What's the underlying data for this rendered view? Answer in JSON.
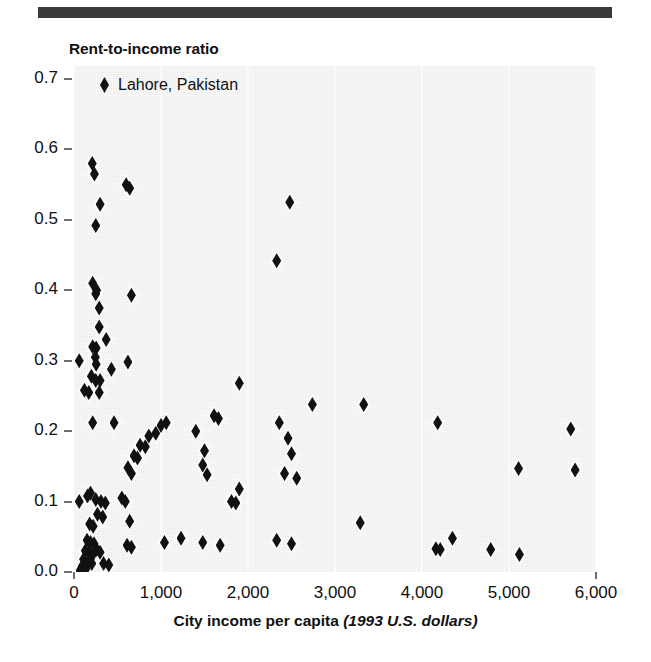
{
  "figure": {
    "y_axis_title": "Rent-to-income ratio",
    "x_axis_title_main": "City income per capita",
    "x_axis_title_units": "(1993 U.S. dollars)",
    "legend_label": "Lahore, Pakistan",
    "marker_color": "#111111",
    "plot_background": "#ebebeb",
    "rule_color": "#3a3a3a"
  },
  "chart_data": {
    "type": "scatter",
    "title": "",
    "xlabel": "City income per capita (1993 U.S. dollars)",
    "ylabel": "Rent-to-income ratio",
    "xlim": [
      0,
      6000
    ],
    "ylim": [
      0.0,
      0.7
    ],
    "xticks": [
      0,
      1000,
      2000,
      3000,
      4000,
      5000,
      6000
    ],
    "xtick_labels": [
      "0",
      "1,000",
      "2,000",
      "3,000",
      "4,000",
      "5,000",
      "6,000"
    ],
    "yticks": [
      0.0,
      0.1,
      0.2,
      0.3,
      0.4,
      0.5,
      0.6,
      0.7
    ],
    "ytick_labels": [
      "0.0",
      "0.1",
      "0.2",
      "0.3",
      "0.4",
      "0.5",
      "0.6",
      "0.7"
    ],
    "grid": "vertical",
    "legend_position": "top-left",
    "series": [
      {
        "name": "Lahore, Pakistan",
        "marker": "diamond",
        "color": "#111111",
        "points": [
          [
            210,
            0.58
          ],
          [
            235,
            0.565
          ],
          [
            300,
            0.522
          ],
          [
            600,
            0.55
          ],
          [
            640,
            0.545
          ],
          [
            2480,
            0.525
          ],
          [
            250,
            0.492
          ],
          [
            2330,
            0.442
          ],
          [
            215,
            0.41
          ],
          [
            260,
            0.4
          ],
          [
            250,
            0.395
          ],
          [
            290,
            0.375
          ],
          [
            660,
            0.393
          ],
          [
            290,
            0.348
          ],
          [
            215,
            0.32
          ],
          [
            255,
            0.318
          ],
          [
            370,
            0.33
          ],
          [
            60,
            0.3
          ],
          [
            245,
            0.305
          ],
          [
            255,
            0.295
          ],
          [
            620,
            0.298
          ],
          [
            250,
            0.272
          ],
          [
            200,
            0.278
          ],
          [
            300,
            0.272
          ],
          [
            430,
            0.288
          ],
          [
            120,
            0.258
          ],
          [
            170,
            0.255
          ],
          [
            290,
            0.255
          ],
          [
            1900,
            0.268
          ],
          [
            2740,
            0.238
          ],
          [
            3330,
            0.238
          ],
          [
            2360,
            0.212
          ],
          [
            4180,
            0.212
          ],
          [
            5710,
            0.203
          ],
          [
            215,
            0.212
          ],
          [
            460,
            0.212
          ],
          [
            1000,
            0.208
          ],
          [
            1060,
            0.212
          ],
          [
            1610,
            0.222
          ],
          [
            1660,
            0.218
          ],
          [
            860,
            0.193
          ],
          [
            940,
            0.197
          ],
          [
            1400,
            0.2
          ],
          [
            2460,
            0.19
          ],
          [
            760,
            0.18
          ],
          [
            820,
            0.178
          ],
          [
            1500,
            0.172
          ],
          [
            2500,
            0.168
          ],
          [
            690,
            0.165
          ],
          [
            730,
            0.162
          ],
          [
            1480,
            0.152
          ],
          [
            2420,
            0.14
          ],
          [
            2560,
            0.133
          ],
          [
            5110,
            0.147
          ],
          [
            5760,
            0.145
          ],
          [
            620,
            0.148
          ],
          [
            660,
            0.14
          ],
          [
            1530,
            0.138
          ],
          [
            1900,
            0.118
          ],
          [
            1810,
            0.1
          ],
          [
            1860,
            0.098
          ],
          [
            60,
            0.1
          ],
          [
            155,
            0.108
          ],
          [
            190,
            0.112
          ],
          [
            250,
            0.103
          ],
          [
            310,
            0.1
          ],
          [
            360,
            0.098
          ],
          [
            550,
            0.105
          ],
          [
            590,
            0.1
          ],
          [
            270,
            0.082
          ],
          [
            330,
            0.078
          ],
          [
            640,
            0.072
          ],
          [
            3290,
            0.07
          ],
          [
            180,
            0.068
          ],
          [
            220,
            0.065
          ],
          [
            1230,
            0.048
          ],
          [
            1480,
            0.042
          ],
          [
            1680,
            0.038
          ],
          [
            2330,
            0.045
          ],
          [
            2500,
            0.04
          ],
          [
            4160,
            0.033
          ],
          [
            4210,
            0.032
          ],
          [
            4350,
            0.048
          ],
          [
            4790,
            0.032
          ],
          [
            5120,
            0.025
          ],
          [
            610,
            0.038
          ],
          [
            660,
            0.035
          ],
          [
            1040,
            0.042
          ],
          [
            150,
            0.045
          ],
          [
            190,
            0.042
          ],
          [
            230,
            0.04
          ],
          [
            130,
            0.03
          ],
          [
            175,
            0.028
          ],
          [
            215,
            0.025
          ],
          [
            110,
            0.018
          ],
          [
            160,
            0.015
          ],
          [
            205,
            0.012
          ],
          [
            95,
            0.008
          ],
          [
            140,
            0.005
          ],
          [
            70,
            0.002
          ],
          [
            130,
            0.012
          ],
          [
            185,
            0.018
          ],
          [
            260,
            0.032
          ],
          [
            300,
            0.028
          ],
          [
            340,
            0.012
          ],
          [
            400,
            0.01
          ]
        ]
      }
    ]
  }
}
